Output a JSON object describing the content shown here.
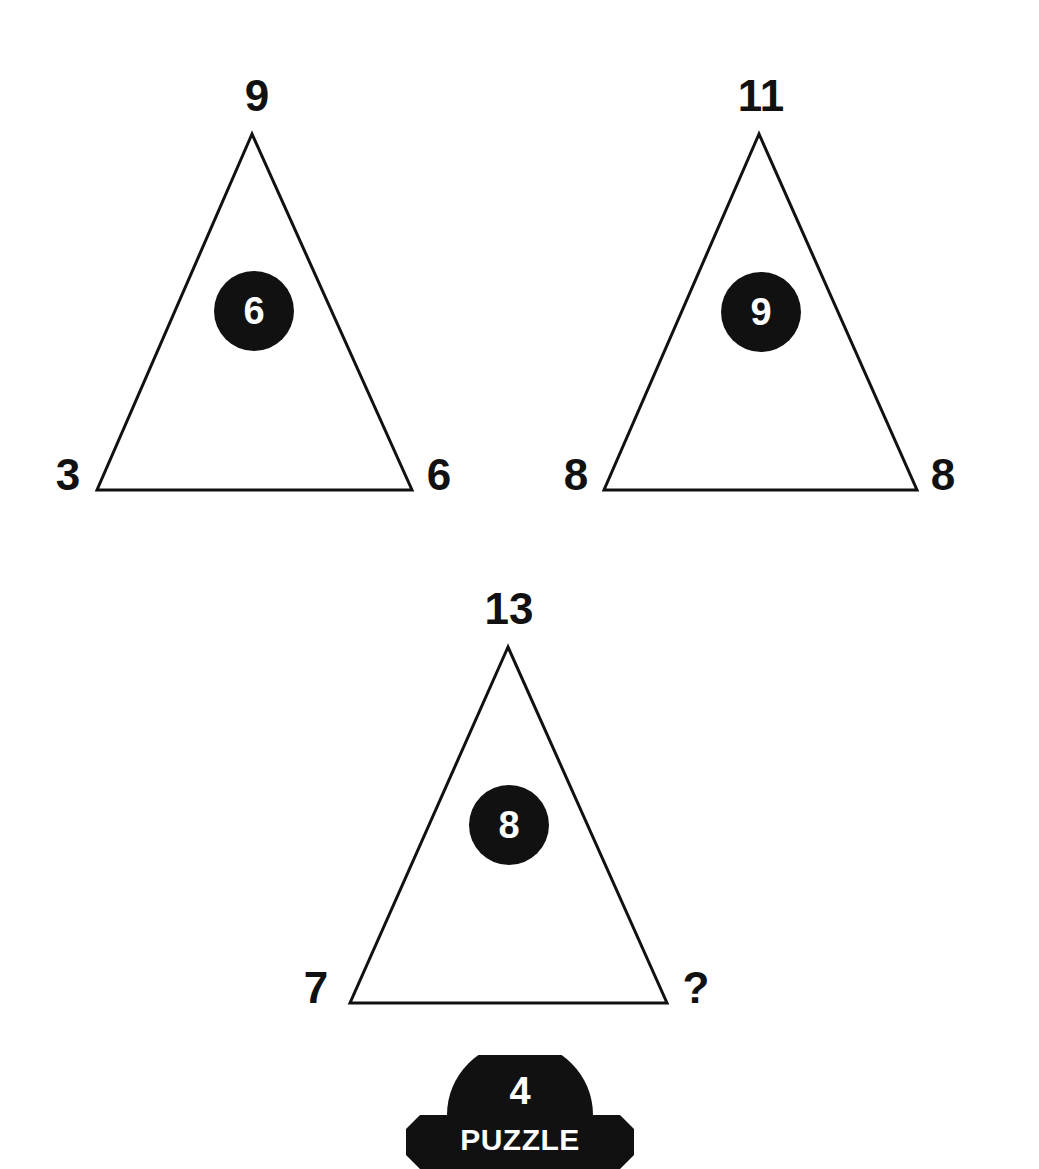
{
  "puzzle": {
    "badge_number": "4",
    "badge_label": "PUZZLE"
  },
  "colors": {
    "ink": "#111111",
    "background": "#ffffff",
    "circle_text": "#ffffff"
  },
  "triangles": [
    {
      "top": "9",
      "left": "3",
      "right": "6",
      "center": "6"
    },
    {
      "top": "11",
      "left": "8",
      "right": "8",
      "center": "9"
    },
    {
      "top": "13",
      "left": "7",
      "right": "?",
      "center": "8"
    }
  ]
}
